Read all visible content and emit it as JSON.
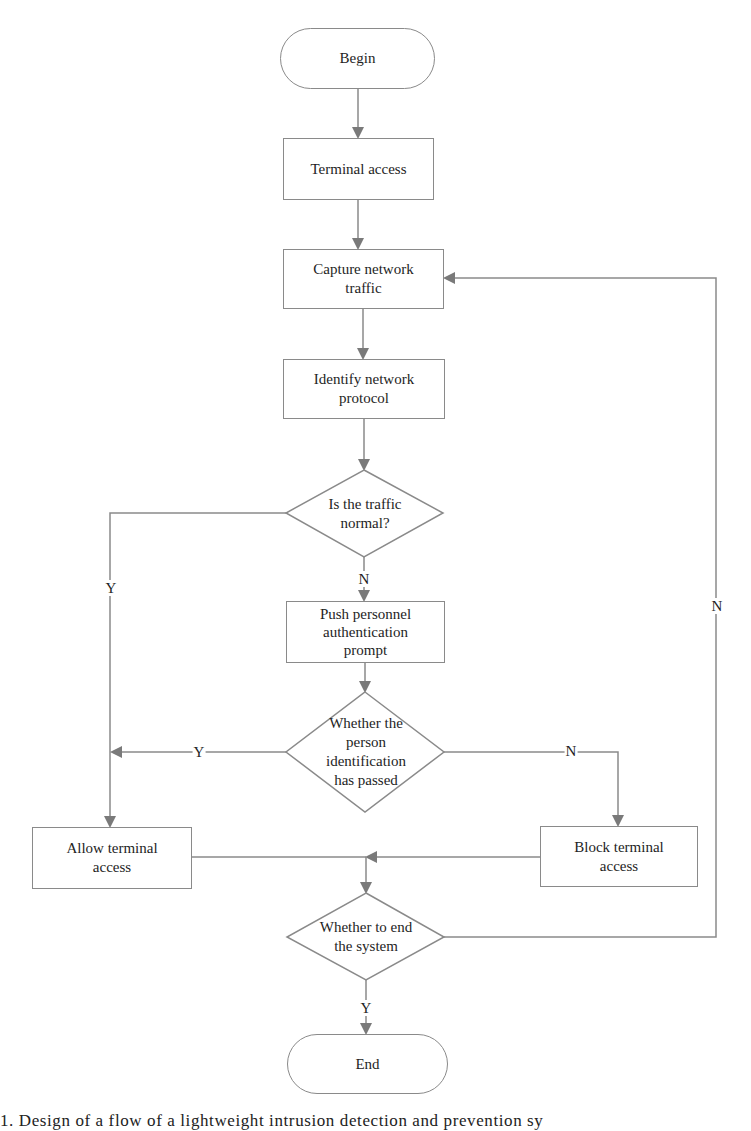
{
  "figure": {
    "type": "flowchart",
    "nodes": {
      "begin": {
        "label": "Begin",
        "shape": "terminal"
      },
      "terminal_access": {
        "label": "Terminal access",
        "shape": "process"
      },
      "capture": {
        "label": "Capture network traffic",
        "shape": "process"
      },
      "identify": {
        "label": "Identify network protocol",
        "shape": "process"
      },
      "is_normal": {
        "label": "Is the traffic normal?",
        "shape": "decision"
      },
      "push_auth": {
        "label": "Push personnel authentication prompt",
        "shape": "process"
      },
      "id_passed": {
        "label": "Whether the person identification has passed",
        "shape": "decision"
      },
      "allow": {
        "label": "Allow terminal access",
        "shape": "process"
      },
      "block": {
        "label": "Block terminal access",
        "shape": "process"
      },
      "end_system": {
        "label": "Whether to end the system",
        "shape": "decision"
      },
      "end": {
        "label": "End",
        "shape": "terminal"
      }
    },
    "edge_labels": {
      "normal_yes": "Y",
      "normal_no": "N",
      "passed_yes": "Y",
      "passed_no": "N",
      "end_yes": "Y",
      "end_no": "N"
    },
    "edges": [
      {
        "from": "begin",
        "to": "terminal_access"
      },
      {
        "from": "terminal_access",
        "to": "capture"
      },
      {
        "from": "capture",
        "to": "identify"
      },
      {
        "from": "identify",
        "to": "is_normal"
      },
      {
        "from": "is_normal",
        "to": "allow",
        "label": "Y"
      },
      {
        "from": "is_normal",
        "to": "push_auth",
        "label": "N"
      },
      {
        "from": "push_auth",
        "to": "id_passed"
      },
      {
        "from": "id_passed",
        "to": "allow",
        "label": "Y"
      },
      {
        "from": "id_passed",
        "to": "block",
        "label": "N"
      },
      {
        "from": "allow",
        "to": "end_system"
      },
      {
        "from": "block",
        "to": "end_system"
      },
      {
        "from": "end_system",
        "to": "end",
        "label": "Y"
      },
      {
        "from": "end_system",
        "to": "capture",
        "label": "N"
      }
    ],
    "colors": {
      "line": "#8a8a8a",
      "arrow": "#7a7a7a",
      "text": "#1e1e1e"
    }
  },
  "caption": "1.  Design of a flow of a lightweight intrusion detection and prevention sy"
}
